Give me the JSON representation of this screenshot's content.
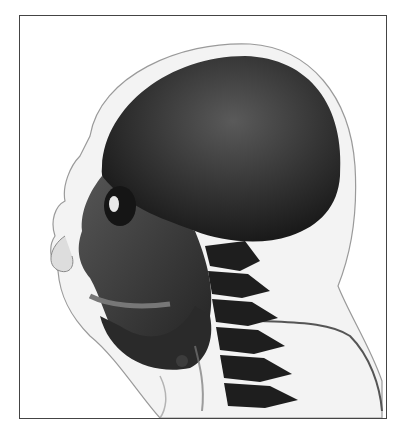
{
  "image": {
    "subject": "3D volume-rendered CT of human head, left lateral view",
    "caption": "",
    "colors": {
      "bone": "#3a3a3a",
      "bone_dark": "#1e1e1e",
      "soft_tissue": "#c9c9c9",
      "background": "#ffffff",
      "border": "#444444"
    }
  }
}
